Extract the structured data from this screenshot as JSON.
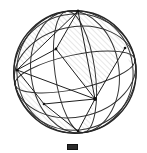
{
  "figure": {
    "name": "hatched-sphere-diagram",
    "canvas": {
      "width": 147,
      "height": 153,
      "background": "#ffffff"
    },
    "sphere": {
      "center_x": 75,
      "center_y": 72,
      "radius": 62,
      "outline_color": "#262626",
      "outline_width": 1.35,
      "fill": "none"
    },
    "hatch": {
      "direction": "/",
      "angle_deg": 45,
      "spacing_px": 4,
      "stroke_color": "#b9b9b9",
      "stroke_width": 0.7,
      "opacity": 0.95
    },
    "stroke": {
      "arc_color": "#333333",
      "arc_width": 1.0,
      "chord_color": "#1e1e1e",
      "chord_width": 1.0
    },
    "nodes": [
      {
        "id": "top-pole",
        "label": "top pole vertex",
        "x": 78,
        "y": 11
      },
      {
        "id": "left-vertex",
        "label": "left edge vertex",
        "x": 17,
        "y": 70
      },
      {
        "id": "right-vertex",
        "label": "right edge vertex",
        "x": 125,
        "y": 48
      },
      {
        "id": "hub",
        "label": "central hub vertex",
        "x": 95,
        "y": 99
      },
      {
        "id": "mid-upper",
        "label": "upper mid vertex",
        "x": 56,
        "y": 49
      },
      {
        "id": "mid-lower",
        "label": "lower left vertex",
        "x": 44,
        "y": 104
      },
      {
        "id": "bottom",
        "label": "bottom vertex",
        "x": 78,
        "y": 131
      }
    ],
    "chords": [
      {
        "from": "top-pole",
        "to": "left-vertex"
      },
      {
        "from": "top-pole",
        "to": "mid-upper"
      },
      {
        "from": "mid-upper",
        "to": "left-vertex"
      },
      {
        "from": "mid-upper",
        "to": "hub"
      },
      {
        "from": "left-vertex",
        "to": "hub"
      },
      {
        "from": "left-vertex",
        "to": "mid-lower"
      },
      {
        "from": "mid-lower",
        "to": "hub"
      },
      {
        "from": "hub",
        "to": "right-vertex"
      },
      {
        "from": "hub",
        "to": "top-pole"
      },
      {
        "from": "hub",
        "to": "bottom"
      },
      {
        "from": "bottom",
        "to": "mid-lower"
      }
    ],
    "arc_count": 7,
    "arc_labels": [
      "outer circle",
      "left meridian",
      "right meridian",
      "central meridian",
      "upper latitude arc",
      "equator arc",
      "lower latitude arc"
    ]
  },
  "caption": {
    "mark_label": "figure-number-block",
    "text": ""
  }
}
